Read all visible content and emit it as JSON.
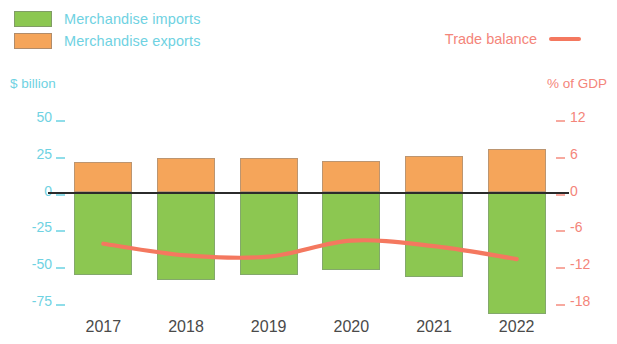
{
  "legend": {
    "imports_label": "Merchandise imports",
    "exports_label": "Merchandise exports",
    "balance_label": "Trade balance",
    "imports_color": "#8CC751",
    "exports_color": "#F5A55A",
    "balance_color": "#F4785F",
    "left_axis_text_color": "#6FD2E2",
    "right_axis_text_color": "#F4857A"
  },
  "axes": {
    "left_title": "$ billion",
    "right_title": "% of GDP",
    "left_ticks": [
      "50",
      "25",
      "0",
      "-25",
      "-50",
      "-75"
    ],
    "right_ticks": [
      "12",
      "6",
      "0",
      "-6",
      "-12",
      "-18"
    ]
  },
  "chart_data": {
    "type": "bar",
    "title": "",
    "subtitle": "",
    "xlabel": "",
    "ylabel": "$ billion",
    "y2label": "% of GDP",
    "categories": [
      "2017",
      "2018",
      "2019",
      "2020",
      "2021",
      "2022"
    ],
    "ylim": [
      -75,
      50
    ],
    "y2lim": [
      -18,
      12
    ],
    "yticks": [
      50,
      25,
      0,
      -25,
      -50,
      -75
    ],
    "y2ticks": [
      12,
      6,
      0,
      -6,
      -12,
      -18
    ],
    "grid": false,
    "legend_position": "top",
    "zero_line": 0,
    "series": [
      {
        "name": "Merchandise exports",
        "axis": "left",
        "units": "$ billion",
        "color": "#F5A55A",
        "values": [
          20,
          23,
          23,
          21,
          24,
          29
        ]
      },
      {
        "name": "Merchandise imports",
        "axis": "left",
        "units": "$ billion",
        "color": "#8CC751",
        "values": [
          -57,
          -60,
          -57,
          -53,
          -58,
          -83
        ]
      },
      {
        "name": "Trade balance",
        "axis": "right",
        "units": "% of GDP",
        "color": "#F4785F",
        "type": "line",
        "values": [
          -8.5,
          -10.4,
          -10.6,
          -8.0,
          -8.9,
          -11.0
        ]
      }
    ]
  }
}
